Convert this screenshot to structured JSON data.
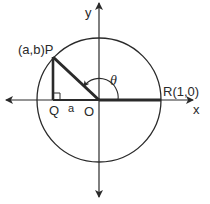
{
  "diagram": {
    "labels": {
      "y_axis": "y",
      "x_axis": "x",
      "point_p": "(a,b)P",
      "point_q": "Q",
      "segment_a": "a",
      "origin": "O",
      "point_r": "R(1,0)",
      "angle": "θ"
    },
    "geometry": {
      "origin": [
        99,
        100
      ],
      "radius": 62,
      "point_p": [
        53,
        57
      ],
      "point_q": [
        53,
        100
      ],
      "point_r": [
        161,
        100
      ]
    },
    "colors": {
      "stroke": "#2a2a2a",
      "background": "#ffffff"
    }
  }
}
